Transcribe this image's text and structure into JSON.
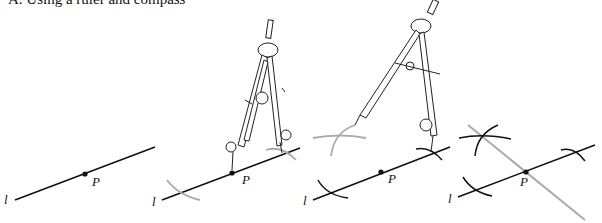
{
  "title": "A.  Using a ruler and compass",
  "panels": [
    {
      "id": 1,
      "line_label": "l",
      "point_label": "P",
      "description": "Line l with point P"
    },
    {
      "id": 2,
      "line_label": "l",
      "point_label": "P",
      "description": "Compass centered at P marks two arcs on l"
    },
    {
      "id": 3,
      "line_label": "l",
      "point_label": "P",
      "description": "Compass centered at arc intersection draws arc above line"
    },
    {
      "id": 4,
      "line_label": "l",
      "point_label": "P",
      "description": "Perpendicular line drawn through P and arc intersection"
    }
  ],
  "colors": {
    "ink": "#111111",
    "construction": "#a8a8a8"
  }
}
